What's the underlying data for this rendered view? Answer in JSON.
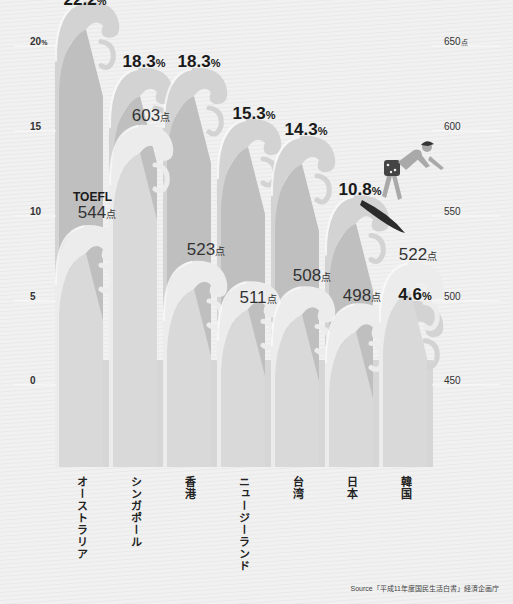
{
  "chart_data": {
    "type": "bar",
    "title": "",
    "categories": [
      "オーストラリア",
      "シンガポール",
      "香港",
      "ニュージーランド",
      "台湾",
      "日本",
      "韓国"
    ],
    "series": [
      {
        "name": "percent",
        "unit": "%",
        "values": [
          22.2,
          18.3,
          18.3,
          15.3,
          14.3,
          10.8,
          4.6
        ],
        "axis": "left"
      },
      {
        "name": "TOEFL",
        "unit": "点",
        "values": [
          544,
          603,
          523,
          511,
          508,
          498,
          522
        ],
        "axis": "right"
      }
    ],
    "left_axis": {
      "ticks": [
        "0",
        "5",
        "10",
        "15",
        "20%"
      ],
      "ylim": [
        0,
        20
      ]
    },
    "right_axis": {
      "ticks": [
        "450",
        "500",
        "550",
        "600",
        "650点"
      ],
      "ylim": [
        450,
        650
      ]
    },
    "grid": false,
    "legend": "none",
    "annotations": [
      "TOEFL",
      "Source「平成11年度国民生活白書」経済企画庁"
    ]
  },
  "axes": {
    "left": [
      {
        "label": "20",
        "unit": "%",
        "y": 36
      },
      {
        "label": "15",
        "unit": "",
        "y": 121
      },
      {
        "label": "10",
        "unit": "",
        "y": 206
      },
      {
        "label": "5",
        "unit": "",
        "y": 291
      },
      {
        "label": "0",
        "unit": "",
        "y": 375
      }
    ],
    "right": [
      {
        "label": "650",
        "unit": "点",
        "y": 36
      },
      {
        "label": "600",
        "unit": "",
        "y": 121
      },
      {
        "label": "550",
        "unit": "",
        "y": 206
      },
      {
        "label": "500",
        "unit": "",
        "y": 291
      },
      {
        "label": "450",
        "unit": "",
        "y": 375
      }
    ]
  },
  "countries": [
    {
      "name": "オーストラリア",
      "pct": "22.2",
      "pct_unit": "%",
      "pts": "544",
      "pts_unit": "点"
    },
    {
      "name": "シンガポール",
      "pct": "18.3",
      "pct_unit": "%",
      "pts": "603",
      "pts_unit": "点"
    },
    {
      "name": "香港",
      "pct": "18.3",
      "pct_unit": "%",
      "pts": "523",
      "pts_unit": "点"
    },
    {
      "name": "ニュージーランド",
      "pct": "15.3",
      "pct_unit": "%",
      "pts": "511",
      "pts_unit": "点"
    },
    {
      "name": "台湾",
      "pct": "14.3",
      "pct_unit": "%",
      "pts": "508",
      "pts_unit": "点"
    },
    {
      "name": "日本",
      "pct": "10.8",
      "pct_unit": "%",
      "pts": "498",
      "pts_unit": "点"
    },
    {
      "name": "韓国",
      "pct": "4.6",
      "pct_unit": "%",
      "pts": "522",
      "pts_unit": "点"
    }
  ],
  "toefl_label": "TOEFL",
  "source": "Source「平成11年度国民生活白書」経済企画庁",
  "colors": {
    "pct_wave": "#d3d3d3",
    "pct_wave_body": "#bfbfbf",
    "pts_wave": "#ececec",
    "pts_wave_body": "#d9d9d9",
    "base": "#d6d6d6",
    "surfer_board": "#2b2b2b",
    "surfer_body": "#a9a9a9"
  }
}
